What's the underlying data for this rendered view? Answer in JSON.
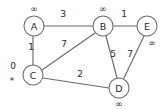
{
  "figure": {
    "name": "weighted-undirected-graph",
    "background_color": "#fdfdfd",
    "stroke_color": "#6b6b6b",
    "text_color": "#2b2b2b",
    "width": 166,
    "height": 110
  },
  "nodes": [
    {
      "id": "A",
      "label": "A",
      "cx": 34,
      "cy": 26,
      "r": 10,
      "distance": "∞",
      "dist_x": 34,
      "dist_y": 9,
      "source_marker": ""
    },
    {
      "id": "B",
      "label": "B",
      "cx": 103,
      "cy": 26,
      "r": 10,
      "distance": "∞",
      "dist_x": 103,
      "dist_y": 9,
      "source_marker": ""
    },
    {
      "id": "C",
      "label": "C",
      "cx": 33,
      "cy": 75,
      "r": 10,
      "distance": "0",
      "dist_x": 13,
      "dist_y": 66,
      "source_marker": "*",
      "marker_x": 12,
      "marker_y": 81
    },
    {
      "id": "D",
      "label": "D",
      "cx": 119,
      "cy": 88,
      "r": 10,
      "distance": "∞",
      "dist_x": 119,
      "dist_y": 104,
      "source_marker": ""
    },
    {
      "id": "E",
      "label": "E",
      "cx": 147,
      "cy": 26,
      "r": 10,
      "distance": "∞",
      "dist_x": 152,
      "dist_y": 43,
      "source_marker": ""
    }
  ],
  "edges": [
    {
      "id": "A-B",
      "from": "A",
      "to": "B",
      "weight": "3",
      "x1": 44,
      "y1": 26,
      "x2": 93,
      "y2": 26,
      "label_x": 63,
      "label_y": 14
    },
    {
      "id": "A-C",
      "from": "A",
      "to": "C",
      "weight": "1",
      "x1": 33,
      "y1": 36,
      "x2": 33,
      "y2": 65,
      "label_x": 31,
      "label_y": 47
    },
    {
      "id": "B-C",
      "from": "B",
      "to": "C",
      "weight": "7",
      "x1": 95,
      "y1": 33,
      "x2": 42,
      "y2": 70,
      "label_x": 64,
      "label_y": 44
    },
    {
      "id": "B-E",
      "from": "B",
      "to": "E",
      "weight": "1",
      "x1": 113,
      "y1": 26,
      "x2": 137,
      "y2": 26,
      "label_x": 124,
      "label_y": 14
    },
    {
      "id": "B-D",
      "from": "B",
      "to": "D",
      "weight": "5",
      "x1": 106,
      "y1": 36,
      "x2": 117,
      "y2": 78,
      "label_x": 113,
      "label_y": 54
    },
    {
      "id": "C-D",
      "from": "C",
      "to": "D",
      "weight": "2",
      "x1": 43,
      "y1": 78,
      "x2": 109,
      "y2": 88,
      "label_x": 80,
      "label_y": 74
    },
    {
      "id": "D-E",
      "from": "D",
      "to": "E",
      "weight": "7",
      "x1": 124,
      "y1": 78,
      "x2": 144,
      "y2": 36,
      "label_x": 130,
      "label_y": 54
    }
  ],
  "legend": {
    "infinity_symbol": "∞",
    "source_symbol": "*"
  }
}
